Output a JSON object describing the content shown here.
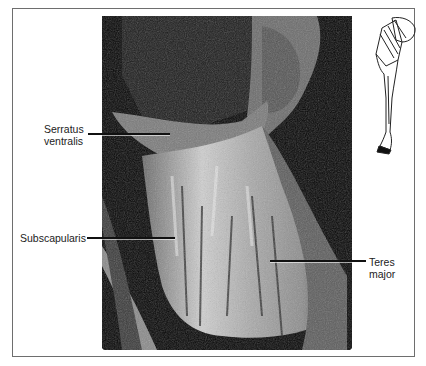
{
  "figure": {
    "labels": {
      "serratus_line1": "Serratus",
      "serratus_line2": "ventralis",
      "subscapularis": "Subscapularis",
      "teres_line1": "Teres",
      "teres_line2": "major"
    },
    "photo": {
      "description": "grayscale dissection photograph of equine thoracic limb, medial view"
    },
    "inset": {
      "description": "line drawing of horse forelimb orientation icon"
    },
    "colors": {
      "border": "#6e6e6e",
      "leader": "#111111",
      "text": "#222222",
      "photo_bg": "#050505"
    }
  }
}
